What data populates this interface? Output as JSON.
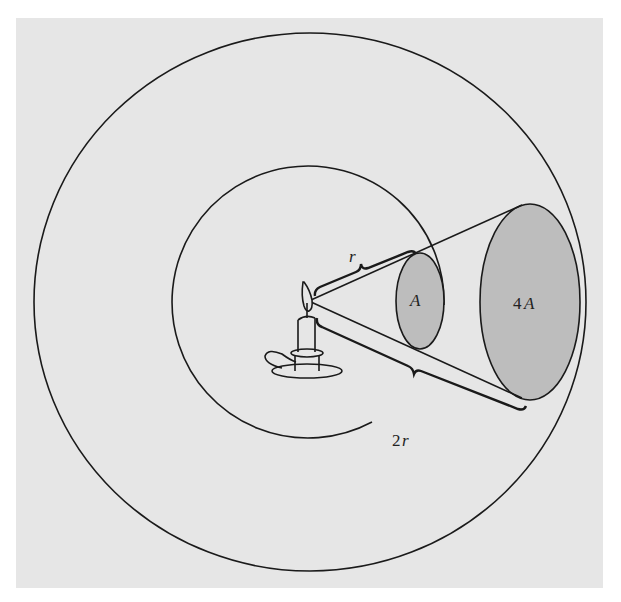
{
  "figure": {
    "labels": {
      "near_distance": "r",
      "far_distance_num": "2",
      "far_distance_var": "r",
      "near_area": "A",
      "far_area_num": "4",
      "far_area_var": "A"
    },
    "colors": {
      "background_panel": "#e6e6e6",
      "area_fill": "#bdbdbd",
      "stroke": "#1a1a1a"
    }
  }
}
